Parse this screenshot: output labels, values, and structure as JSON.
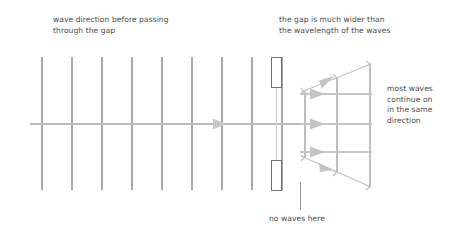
{
  "diagram": {
    "type": "physics-wavefront-diagram",
    "canvas": {
      "width": 454,
      "height": 237,
      "background": "#ffffff"
    },
    "colors": {
      "wavefront_line": "#a8a8a8",
      "axis_line": "#b4b4b4",
      "arrow_fill": "#c4c4c4",
      "barrier_stroke": "#6b6b6b",
      "barrier_fill": "#ffffff",
      "text": "#4a4a4a",
      "diffracted_line": "#bdbdbd"
    },
    "labels": {
      "wave_direction": "wave direction before passing\nthrough the gap",
      "gap_width": "the gap is much wider than\nthe wavelength of the waves",
      "most_waves": "most waves\ncontinue on\nin the same\ndirection",
      "no_waves": "no waves here"
    },
    "incoming_wavefronts": {
      "count": 9,
      "x_positions": [
        42,
        72,
        102,
        132,
        162,
        192,
        222,
        252,
        282
      ],
      "y_top": 57,
      "y_bottom": 190,
      "description": "parallel straight wavefronts travelling left to right"
    },
    "central_axis": {
      "y": 124,
      "x_start": 30,
      "x_end": 372,
      "arrow_x": 218,
      "description": "direction of wave travel"
    },
    "barrier": {
      "x": 271,
      "width": 11,
      "upper_block": {
        "y_top": 57,
        "y_bottom": 88
      },
      "lower_block": {
        "y_top": 160,
        "y_bottom": 191
      },
      "gap": {
        "y_top": 88,
        "y_bottom": 160,
        "x": 276
      },
      "description": "two barrier blocks separated by a wide gap"
    },
    "diffracted_wavefronts": {
      "x_positions": [
        305,
        337,
        370
      ],
      "y_top": 64,
      "y_bottom": 186,
      "description": "wavefronts after the gap, still mostly straight and parallel"
    },
    "diffracted_rays": {
      "y_positions": [
        94,
        124,
        152
      ],
      "x_start": 300,
      "x_end": 372,
      "arrow_x": 312,
      "description": "horizontal rays showing most waves continue straight on"
    },
    "spreading_rays": [
      {
        "name": "upper-spreading-ray",
        "from": [
          302,
          92
        ],
        "to": [
          370,
          64
        ],
        "arrow_x": 330,
        "description": "slight spreading of waves at the upper gap edge"
      },
      {
        "name": "lower-spreading-ray",
        "from": [
          302,
          156
        ],
        "to": [
          370,
          186
        ],
        "arrow_x": 330,
        "description": "slight spreading of waves at the lower gap edge"
      }
    ],
    "pointer_lines": [
      {
        "name": "no-waves-pointer",
        "x": 300,
        "y_top": 182,
        "y_bottom": 210,
        "description": "leader line from the no waves here label to the shadow region"
      }
    ]
  }
}
